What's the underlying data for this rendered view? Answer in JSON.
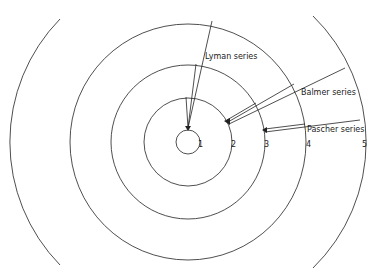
{
  "orbit_labels": [
    "1",
    "2",
    "3",
    "4",
    "5"
  ],
  "series": [
    {
      "name": "Lyman series",
      "final_level": 1,
      "from_levels": [
        2,
        3,
        4
      ]
    },
    {
      "name": "Balmer series",
      "final_level": 2,
      "from_levels": [
        3,
        4,
        5
      ]
    },
    {
      "name": "Pascher series",
      "final_level": 3,
      "from_levels": [
        4,
        5
      ]
    }
  ],
  "labels": {
    "lyman": "Lyman series",
    "balmer": "Balmer series",
    "paschen": "Pascher series"
  },
  "colors": {
    "line": "#222222",
    "background": "#ffffff"
  }
}
